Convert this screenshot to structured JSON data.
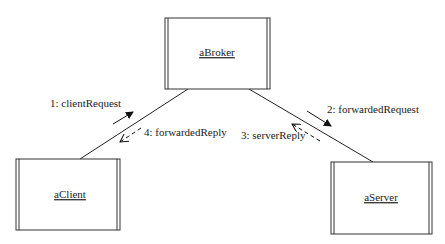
{
  "diagram": {
    "type": "collaboration",
    "objects": [
      {
        "id": "broker",
        "label": "aBroker",
        "x": 165,
        "y": 18,
        "w": 105,
        "h": 71
      },
      {
        "id": "client",
        "label": "aClient",
        "x": 16,
        "y": 159,
        "w": 104,
        "h": 71
      },
      {
        "id": "server",
        "label": "aServer",
        "x": 331,
        "y": 162,
        "w": 101,
        "h": 72
      }
    ],
    "links": [
      {
        "from": "broker",
        "to": "client"
      },
      {
        "from": "broker",
        "to": "server"
      }
    ],
    "messages": [
      {
        "label": "1: clientRequest",
        "style": "solid",
        "direction": "client-to-broker"
      },
      {
        "label": "2: forwardedRequest",
        "style": "solid",
        "direction": "broker-to-server"
      },
      {
        "label": "3: serverReply",
        "style": "dashed",
        "direction": "server-to-broker"
      },
      {
        "label": "4: forwardedReply",
        "style": "dashed",
        "direction": "broker-to-client"
      }
    ]
  }
}
